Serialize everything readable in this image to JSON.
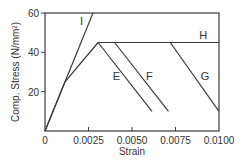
{
  "chart_data": {
    "type": "line",
    "title": "",
    "xlabel": "Strain",
    "ylabel": "Comp. Stress (N/mm²)",
    "xlim": [
      0,
      0.01
    ],
    "ylim": [
      0,
      60
    ],
    "grid": false,
    "legend": "none (inline curve labels)",
    "xticks": [
      0,
      0.0025,
      0.005,
      0.0075,
      0.01
    ],
    "xtick_labels": [
      "0",
      "0.0025",
      "0.0050",
      "0.0075",
      "0.0100"
    ],
    "yticks": [
      20,
      40,
      60
    ],
    "ytick_labels": [
      "20",
      "40",
      "60"
    ],
    "series": [
      {
        "name": "I",
        "x": [
          0,
          0.00276
        ],
        "y": [
          0,
          60
        ]
      },
      {
        "name": "base",
        "x": [
          0,
          0.00115,
          0.00305
        ],
        "y": [
          0,
          25,
          45
        ]
      },
      {
        "name": "H",
        "x": [
          0.00305,
          0.01
        ],
        "y": [
          45,
          45
        ]
      },
      {
        "name": "E",
        "x": [
          0.00305,
          0.00615
        ],
        "y": [
          45,
          10
        ]
      },
      {
        "name": "F",
        "x": [
          0.004,
          0.0071
        ],
        "y": [
          45,
          10
        ]
      },
      {
        "name": "G",
        "x": [
          0.0072,
          0.01
        ],
        "y": [
          45,
          10
        ]
      }
    ],
    "annotations": [
      {
        "text": "I",
        "x": 0.0021,
        "y": 54
      },
      {
        "text": "H",
        "x": 0.0091,
        "y": 47
      },
      {
        "text": "E",
        "x": 0.0041,
        "y": 26
      },
      {
        "text": "F",
        "x": 0.006,
        "y": 26
      },
      {
        "text": "G",
        "x": 0.0092,
        "y": 26
      }
    ]
  }
}
